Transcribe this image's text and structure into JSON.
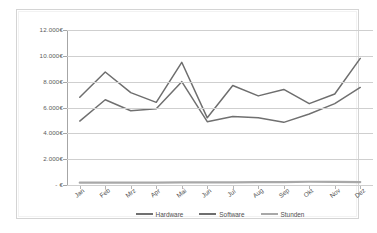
{
  "chart_data": {
    "type": "line",
    "title": "",
    "subtitle": "",
    "xlabel": "",
    "ylabel": "",
    "grid": true,
    "legend_position": "bottom",
    "categories": [
      "Jan",
      "Feb",
      "Mrz",
      "Apr",
      "Mai",
      "Jun",
      "Jul",
      "Aug",
      "Sep",
      "Okt",
      "Nov",
      "Dez"
    ],
    "ylim": [
      0,
      12000
    ],
    "ytick_values": [
      12000,
      10000,
      8000,
      6000,
      4000,
      2000,
      0
    ],
    "ytick_labels": [
      "12.000€",
      "10.000€",
      "8.000€",
      "6.000€",
      "4.000€",
      "2.000€",
      "-   €"
    ],
    "series": [
      {
        "name": "Hardware",
        "color": "#707070",
        "values": [
          4950,
          6600,
          5750,
          5900,
          8000,
          4900,
          5300,
          5200,
          4850,
          5500,
          6300,
          7550
        ]
      },
      {
        "name": "Software",
        "color": "#6e6e6e",
        "values": [
          6800,
          8750,
          7150,
          6400,
          9500,
          5200,
          7700,
          6900,
          7400,
          6300,
          7050,
          9800
        ]
      },
      {
        "name": "Stunden",
        "color": "#a8a8a8",
        "values": [
          180,
          180,
          190,
          190,
          200,
          200,
          210,
          215,
          220,
          250,
          240,
          230
        ]
      }
    ]
  },
  "legend": {
    "items": [
      {
        "label": "Hardware",
        "color": "#707070"
      },
      {
        "label": "Software",
        "color": "#6e6e6e"
      },
      {
        "label": "Stunden",
        "color": "#a8a8a8"
      }
    ]
  }
}
